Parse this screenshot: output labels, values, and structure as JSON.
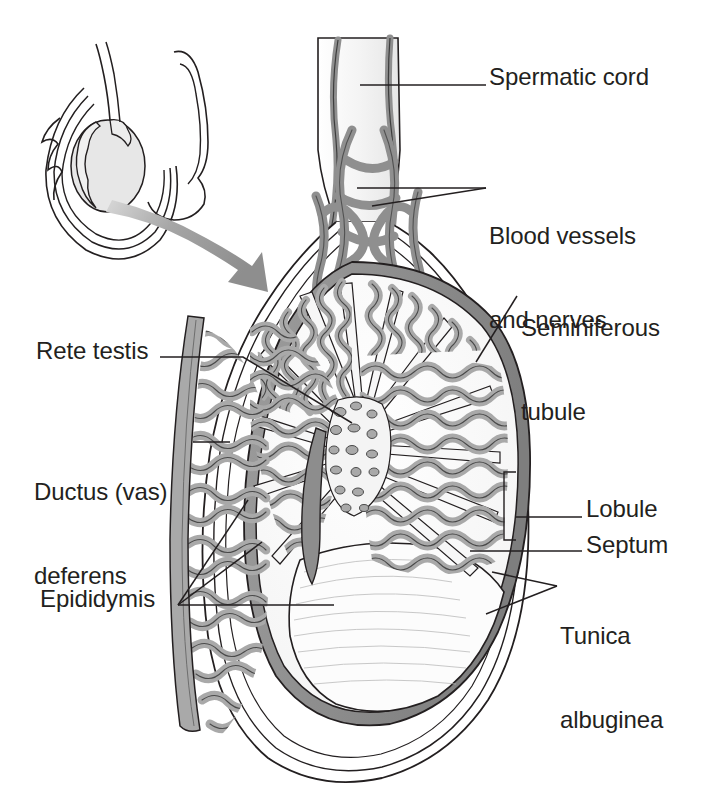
{
  "figure": {
    "view": "cut-away sagittal section with inset orientation drawing",
    "background_color": "#ffffff",
    "ink_color": "#231f20",
    "palette": {
      "outline": "#231f20",
      "tubule_fill": "#a9a9a9",
      "tubule_stroke": "#4a4a4a",
      "tunica_albuginea": "#8d8d8d",
      "vessel_fill": "#8f8f8f",
      "vessel_stroke": "#3d3d3d",
      "cord_fill": "#f2f2f2",
      "pale_fill": "#fbfbfb",
      "arrow_fill": "#9a9a9a",
      "inset_fill": "#e9e9e9"
    }
  },
  "labels": [
    {
      "id": "spermatic-cord",
      "text": "Spermatic cord",
      "lines": [
        "Spermatic cord"
      ],
      "side": "right",
      "x": 489,
      "y": 63,
      "leader": [
        [
          486,
          85
        ],
        [
          360,
          85
        ]
      ]
    },
    {
      "id": "blood-vessels-and-nerves",
      "text": "Blood vessels and nerves",
      "lines": [
        "Blood vessels",
        "and nerves"
      ],
      "side": "right",
      "x": 489,
      "y": 166,
      "leader": [
        [
          486,
          188
        ],
        [
          357,
          188
        ]
      ],
      "extra_leader": [
        [
          486,
          188
        ],
        [
          380,
          205
        ]
      ]
    },
    {
      "id": "seminiferous-tubule",
      "text": "Seminiferous tubule",
      "lines": [
        "Seminiferous",
        "tubule"
      ],
      "side": "right",
      "x": 521,
      "y": 258,
      "leader": [
        [
          517,
          295
        ],
        [
          478,
          360
        ]
      ]
    },
    {
      "id": "lobule",
      "text": "Lobule",
      "lines": [
        "Lobule"
      ],
      "side": "right",
      "x": 586,
      "y": 495,
      "leader": [
        [
          582,
          517
        ],
        [
          516,
          517
        ]
      ]
    },
    {
      "id": "septum",
      "text": "Septum",
      "lines": [
        "Septum"
      ],
      "side": "right",
      "x": 586,
      "y": 531,
      "leader": [
        [
          582,
          551
        ],
        [
          490,
          551
        ]
      ]
    },
    {
      "id": "tunica-albuginea",
      "text": "Tunica albuginea",
      "lines": [
        "Tunica",
        "albuginea"
      ],
      "side": "right",
      "x": 560,
      "y": 566,
      "leader": [
        [
          557,
          586
        ],
        [
          498,
          586
        ]
      ],
      "extra_leader": [
        [
          557,
          586
        ],
        [
          493,
          612
        ]
      ]
    },
    {
      "id": "rete-testis",
      "text": "Rete testis",
      "lines": [
        "Rete testis"
      ],
      "side": "left",
      "x": 36,
      "y": 337,
      "leader": [
        [
          160,
          357
        ],
        [
          243,
          357
        ],
        [
          352,
          423
        ]
      ]
    },
    {
      "id": "ductus-vas-deferens",
      "text": "Ductus (vas) deferens",
      "lines": [
        "Ductus (vas)",
        "deferens"
      ],
      "side": "left",
      "x": 34,
      "y": 422,
      "leader": [
        [
          193,
          442
        ],
        [
          228,
          442
        ]
      ]
    },
    {
      "id": "epididymis",
      "text": "Epididymis",
      "lines": [
        "Epididymis"
      ],
      "side": "left",
      "x": 40,
      "y": 585,
      "leader": [
        [
          178,
          605
        ],
        [
          330,
          605
        ]
      ],
      "extra_leader": [
        [
          178,
          605
        ],
        [
          260,
          545
        ]
      ],
      "extra_leader2": [
        [
          178,
          605
        ],
        [
          245,
          505
        ]
      ]
    }
  ],
  "inset": {
    "id": "orientation-inset",
    "description": "small outline drawing of scrotum and penis with shaded testis, pointing to the enlarged section",
    "x": 28,
    "y": 84,
    "width": 190,
    "height": 180,
    "arrow": {
      "id": "magnify-arrow",
      "description": "tapered gray arrow sweeping from the inset down-right to the large testis",
      "from": [
        108,
        205
      ],
      "to": [
        262,
        280
      ]
    }
  },
  "structures": [
    {
      "id": "spermatic-cord",
      "name": "Spermatic cord",
      "note": "pale vertical cord at top containing vessels"
    },
    {
      "id": "pampiniform-plexus",
      "name": "Blood vessels and nerves",
      "note": "braided gray vascular network below the cord"
    },
    {
      "id": "tunica-albuginea",
      "name": "Tunica albuginea",
      "note": "dark gray capsule band around testis"
    },
    {
      "id": "tunica-vaginalis",
      "name": "Tunica vaginalis",
      "note": "thin outer serous layers"
    },
    {
      "id": "seminiferous-tubules",
      "name": "Seminiferous tubules",
      "note": "gray convoluted tubules filling the lobules"
    },
    {
      "id": "septum",
      "name": "Septum",
      "note": "pale fibrous partition between lobules"
    },
    {
      "id": "lobule",
      "name": "Lobule",
      "note": "wedge compartment of tubules"
    },
    {
      "id": "rete-testis",
      "name": "Rete testis",
      "note": "network of channels at the hilum"
    },
    {
      "id": "epididymis",
      "name": "Epididymis",
      "note": "coiled duct along posterior border"
    },
    {
      "id": "ductus-deferens",
      "name": "Ductus (vas) deferens",
      "note": "thick duct ascending on the left"
    }
  ]
}
